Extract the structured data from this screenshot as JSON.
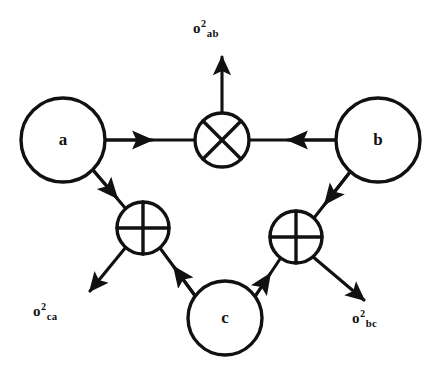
{
  "diagram": {
    "background_color": "#ffffff",
    "stroke_color": "#111111",
    "nodes": [
      {
        "id": "a",
        "label": "a",
        "type": "source-circle",
        "cx": 63,
        "cy": 140,
        "r": 42
      },
      {
        "id": "b",
        "label": "b",
        "type": "source-circle",
        "cx": 378,
        "cy": 140,
        "r": 42
      },
      {
        "id": "c",
        "label": "c",
        "type": "source-circle",
        "cx": 225,
        "cy": 318,
        "r": 37
      },
      {
        "id": "mult-ab",
        "label": "",
        "type": "multiplier-cross-circle",
        "cx": 222,
        "cy": 140,
        "r": 27
      },
      {
        "id": "sum-ca",
        "label": "",
        "type": "adder-plus-circle",
        "cx": 143,
        "cy": 228,
        "r": 26
      },
      {
        "id": "sum-bc",
        "label": "",
        "type": "adder-plus-circle",
        "cx": 296,
        "cy": 237,
        "r": 26
      }
    ],
    "edges": [
      {
        "id": "a-to-mult",
        "from": "a",
        "to": "mult-ab",
        "direction": "right"
      },
      {
        "id": "b-to-mult",
        "from": "b",
        "to": "mult-ab",
        "direction": "left"
      },
      {
        "id": "mult-to-out",
        "from": "mult-ab",
        "to": "sigma-ab",
        "direction": "up"
      },
      {
        "id": "a-to-sum-ca",
        "from": "a",
        "to": "sum-ca",
        "direction": "down-right"
      },
      {
        "id": "c-to-sum-ca",
        "from": "c",
        "to": "sum-ca",
        "direction": "up-left"
      },
      {
        "id": "sum-ca-to-out",
        "from": "sum-ca",
        "to": "sigma-ca",
        "direction": "down-left"
      },
      {
        "id": "b-to-sum-bc",
        "from": "b",
        "to": "sum-bc",
        "direction": "down-left"
      },
      {
        "id": "c-to-sum-bc",
        "from": "c",
        "to": "sum-bc",
        "direction": "up-right"
      },
      {
        "id": "sum-bc-to-out",
        "from": "sum-bc",
        "to": "sigma-bc",
        "direction": "down-right"
      }
    ],
    "output_labels": {
      "sigma_ab": {
        "symbol": "o",
        "superscript": "2",
        "subscript": "ab"
      },
      "sigma_ca": {
        "symbol": "o",
        "superscript": "2",
        "subscript": "ca"
      },
      "sigma_bc": {
        "symbol": "o",
        "superscript": "2",
        "subscript": "bc"
      }
    }
  }
}
